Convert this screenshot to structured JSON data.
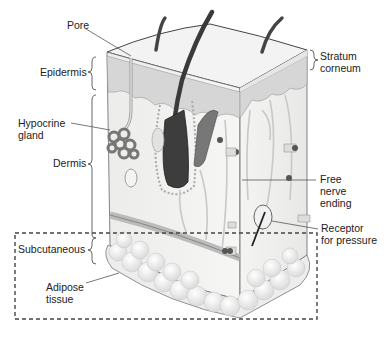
{
  "diagram": {
    "labels": {
      "pore": "Pore",
      "epidermis": "Epidermis",
      "hypocrine_gland_line1": "Hypocrine",
      "hypocrine_gland_line2": "gland",
      "dermis": "Dermis",
      "subcutaneous": "Subcutaneous",
      "adipose_line1": "Adipose",
      "adipose_line2": "tissue",
      "stratum_line1": "Stratum",
      "stratum_line2": "corneum",
      "free_nerve_line1": "Free",
      "free_nerve_line2": "nerve",
      "free_nerve_line3": "ending",
      "receptor_line1": "Receptor",
      "receptor_line2": "for pressure"
    },
    "colors": {
      "epidermis_fill": "#d9d9d9",
      "dermis_fill": "#f1f1ee",
      "hair": "#444444",
      "adipose": "#f4f4f4",
      "outline": "#555555"
    }
  }
}
